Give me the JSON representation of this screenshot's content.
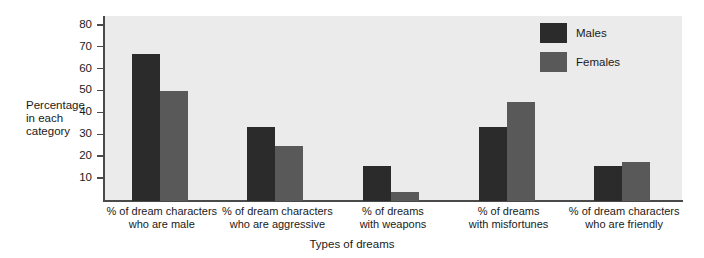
{
  "chart_data": {
    "type": "bar",
    "title": "",
    "xlabel": "Types of dreams",
    "ylabel": "Percentage in each category",
    "ylabel_lines": [
      "Percentage",
      "in each",
      "category"
    ],
    "ylim": [
      0,
      84
    ],
    "yticks": [
      10,
      20,
      30,
      40,
      50,
      60,
      70,
      80
    ],
    "ytick_labels": [
      "10",
      "20",
      "30",
      "40",
      "50",
      "60",
      "70",
      "80"
    ],
    "grid": false,
    "legend_position": "top-right",
    "categories": [
      "% of dream characters who are male",
      "% of dream characters who are aggressive",
      "% of dreams with weapons",
      "% of dreams with misfortunes",
      "% of dream characters who are friendly"
    ],
    "category_lines": [
      [
        "% of dream characters",
        "who are male"
      ],
      [
        "% of dream characters",
        "who are aggressive"
      ],
      [
        "% of dreams",
        "with weapons"
      ],
      [
        "% of dreams",
        "with misfortunes"
      ],
      [
        "% of dream characters",
        "who are friendly"
      ]
    ],
    "series": [
      {
        "name": "Males",
        "color": "#2b2b2b",
        "values": [
          67,
          34,
          16,
          34,
          16
        ]
      },
      {
        "name": "Females",
        "color": "#595959",
        "values": [
          50,
          25,
          4,
          45,
          18
        ]
      }
    ]
  },
  "legend": {
    "items": [
      {
        "label": "Males",
        "color": "#2b2b2b"
      },
      {
        "label": "Females",
        "color": "#595959"
      }
    ]
  },
  "colors": {
    "plot_background": "#ebebeb",
    "page_background": "#ffffff",
    "axis": "#4a4a4a",
    "text": "#1a1a1a",
    "males": "#2b2b2b",
    "females": "#595959"
  }
}
